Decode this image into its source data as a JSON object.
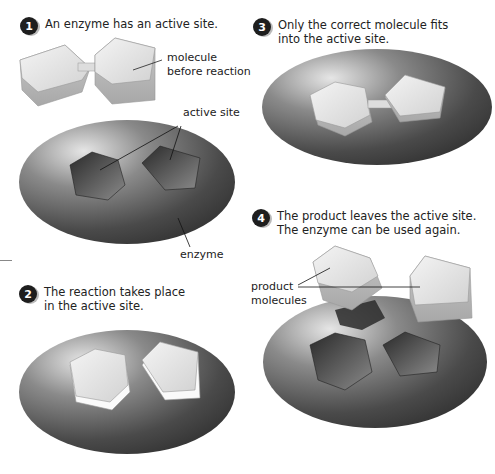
{
  "steps": [
    {
      "number": "1",
      "text_lines": [
        "An enzyme has an active site."
      ]
    },
    {
      "number": "2",
      "text_lines": [
        "The reaction takes place",
        "in the active site."
      ]
    },
    {
      "number": "3",
      "text_lines": [
        "Only the correct molecule fits",
        "into the active site."
      ]
    },
    {
      "number": "4",
      "text_lines": [
        "The product leaves the active site.",
        "The enzyme can be used again."
      ]
    }
  ],
  "labels": {
    "molecule_line1": "molecule",
    "molecule_line2": "before reaction",
    "active_site": "active site",
    "enzyme": "enzyme",
    "product_line1": "product",
    "product_line2": "molecules"
  },
  "colors": {
    "enzyme_dark": "#3a3a3a",
    "enzyme_light": "#d9d9d9",
    "molecule_top": "#e6e6e6",
    "molecule_side": "#bdbdbd",
    "step_badge": "#1e1e1e"
  }
}
